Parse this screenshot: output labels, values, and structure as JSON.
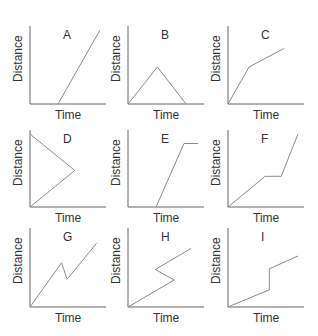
{
  "chart_data": [
    {
      "type": "line",
      "title": "A",
      "xlabel": "Time",
      "ylabel": "Distance",
      "points": [
        [
          0.4,
          0
        ],
        [
          1,
          1
        ]
      ]
    },
    {
      "type": "line",
      "title": "B",
      "xlabel": "Time",
      "ylabel": "Distance",
      "points": [
        [
          0,
          0
        ],
        [
          0.42,
          0.5
        ],
        [
          0.83,
          0
        ]
      ]
    },
    {
      "type": "line",
      "title": "C",
      "xlabel": "Time",
      "ylabel": "Distance",
      "points": [
        [
          0,
          0
        ],
        [
          0.3,
          0.5
        ],
        [
          0.8,
          0.75
        ]
      ]
    },
    {
      "type": "line",
      "title": "D",
      "xlabel": "Time",
      "ylabel": "Distance",
      "points": [
        [
          0,
          1
        ],
        [
          0.64,
          0.5
        ],
        [
          0,
          0
        ]
      ]
    },
    {
      "type": "line",
      "title": "E",
      "xlabel": "Time",
      "ylabel": "Distance",
      "points": [
        [
          0.4,
          0
        ],
        [
          0.8,
          0.87
        ],
        [
          1,
          0.87
        ]
      ]
    },
    {
      "type": "line",
      "title": "F",
      "xlabel": "Time",
      "ylabel": "Distance",
      "points": [
        [
          0,
          0
        ],
        [
          0.53,
          0.42
        ],
        [
          0.76,
          0.42
        ],
        [
          1,
          1
        ]
      ]
    },
    {
      "type": "line",
      "title": "G",
      "xlabel": "Time",
      "ylabel": "Distance",
      "points": [
        [
          0,
          0
        ],
        [
          0.45,
          0.59
        ],
        [
          0.53,
          0.37
        ],
        [
          0.95,
          0.85
        ]
      ]
    },
    {
      "type": "line",
      "title": "H",
      "xlabel": "Time",
      "ylabel": "Distance",
      "points": [
        [
          0,
          0
        ],
        [
          0.66,
          0.36
        ],
        [
          0.39,
          0.5
        ],
        [
          0.9,
          0.78
        ]
      ]
    },
    {
      "type": "line",
      "title": "I",
      "xlabel": "Time",
      "ylabel": "Distance",
      "points": [
        [
          0,
          0
        ],
        [
          0.59,
          0.23
        ],
        [
          0.59,
          0.51
        ],
        [
          1,
          0.68
        ]
      ]
    }
  ],
  "panels": [
    {
      "title": "A",
      "xlabel": "Time",
      "ylabel": "Distance"
    },
    {
      "title": "B",
      "xlabel": "Time",
      "ylabel": "Distance"
    },
    {
      "title": "C",
      "xlabel": "Time",
      "ylabel": "Distance"
    },
    {
      "title": "D",
      "xlabel": "Time",
      "ylabel": "Distance"
    },
    {
      "title": "E",
      "xlabel": "Time",
      "ylabel": "Distance"
    },
    {
      "title": "F",
      "xlabel": "Time",
      "ylabel": "Distance"
    },
    {
      "title": "G",
      "xlabel": "Time",
      "ylabel": "Distance"
    },
    {
      "title": "H",
      "xlabel": "Time",
      "ylabel": "Distance"
    },
    {
      "title": "I",
      "xlabel": "Time",
      "ylabel": "Distance"
    }
  ],
  "colors": {
    "axis": "#666666",
    "line": "#8a8a8a",
    "text": "#333333"
  }
}
